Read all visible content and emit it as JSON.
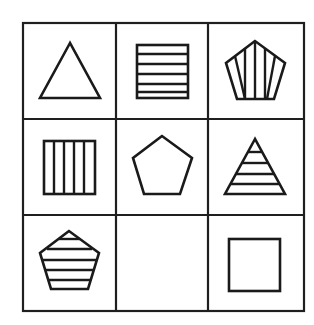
{
  "puzzle": {
    "title": "3x3 figure matrix",
    "rows": 3,
    "cols": 3,
    "line_color": "#1f1f1f",
    "background": "#ffffff",
    "cells": [
      {
        "row": 1,
        "col": 1,
        "shape": "triangle",
        "fill": "empty",
        "label": "Empty triangle"
      },
      {
        "row": 1,
        "col": 2,
        "shape": "square",
        "fill": "horizontal-stripes",
        "label": "Square with horizontal stripes"
      },
      {
        "row": 1,
        "col": 3,
        "shape": "pentagon",
        "fill": "vertical-stripes",
        "label": "Pentagon with vertical stripes"
      },
      {
        "row": 2,
        "col": 1,
        "shape": "square",
        "fill": "vertical-stripes",
        "label": "Square with vertical stripes"
      },
      {
        "row": 2,
        "col": 2,
        "shape": "pentagon",
        "fill": "empty",
        "label": "Empty pentagon"
      },
      {
        "row": 2,
        "col": 3,
        "shape": "triangle",
        "fill": "horizontal-stripes",
        "label": "Triangle with horizontal stripes"
      },
      {
        "row": 3,
        "col": 1,
        "shape": "pentagon",
        "fill": "horizontal-stripes",
        "label": "Pentagon with horizontal stripes"
      },
      {
        "row": 3,
        "col": 2,
        "shape": "none",
        "fill": "blank",
        "label": "Missing figure"
      },
      {
        "row": 3,
        "col": 3,
        "shape": "square",
        "fill": "empty",
        "label": "Empty square"
      }
    ]
  }
}
